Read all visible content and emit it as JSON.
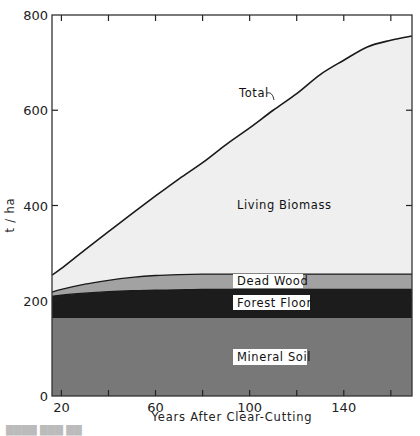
{
  "chart_data": {
    "type": "area",
    "stacked": true,
    "title": "",
    "xlabel": "Years After Clear-Cutting",
    "ylabel": "t/ha",
    "xlim": [
      16,
      169
    ],
    "ylim": [
      0,
      800
    ],
    "x_ticks": [
      20,
      40,
      60,
      80,
      100,
      120,
      140,
      160
    ],
    "x_tick_labels": [
      "20",
      "60",
      "100",
      "140"
    ],
    "x_tick_label_values": [
      20,
      60,
      100,
      140
    ],
    "y_ticks": [
      0,
      200,
      400,
      600,
      800
    ],
    "y_tick_labels": [
      "0",
      "200",
      "400",
      "600",
      "800"
    ],
    "grid": false,
    "legend": "inline labels",
    "x": [
      16,
      20,
      30,
      40,
      50,
      60,
      70,
      80,
      90,
      100,
      110,
      120,
      130,
      140,
      150,
      160,
      169
    ],
    "boundaries": [
      {
        "name": "Mineral Soil",
        "color": "#787878",
        "values": [
          164,
          164,
          164,
          164,
          164,
          164,
          164,
          164,
          164,
          164,
          164,
          164,
          164,
          164,
          164,
          164,
          164
        ]
      },
      {
        "name": "Forest Floor",
        "color": "#1c1c1c",
        "values": [
          209,
          212,
          216,
          219,
          221,
          222,
          223,
          224,
          224,
          224,
          224,
          224,
          224,
          224,
          224,
          224,
          224
        ]
      },
      {
        "name": "Dead Wood",
        "color": "#a2a2a2",
        "values": [
          218,
          224,
          235,
          243,
          249,
          253,
          255,
          256,
          256,
          256,
          256,
          256,
          256,
          256,
          256,
          256,
          256
        ]
      },
      {
        "name": "Living Biomass",
        "color": "#efefef",
        "values": [
          254,
          268,
          307,
          345,
          383,
          420,
          456,
          490,
          528,
          563,
          600,
          635,
          675,
          705,
          733,
          747,
          756
        ]
      }
    ],
    "series": [
      {
        "name": "Mineral Soil",
        "values": [
          164,
          164,
          164,
          164,
          164,
          164,
          164,
          164,
          164,
          164,
          164,
          164,
          164,
          164,
          164,
          164,
          164
        ]
      },
      {
        "name": "Forest Floor",
        "values": [
          45,
          48,
          52,
          55,
          57,
          58,
          59,
          60,
          60,
          60,
          60,
          60,
          60,
          60,
          60,
          60,
          60
        ]
      },
      {
        "name": "Dead Wood",
        "values": [
          9,
          12,
          19,
          24,
          28,
          31,
          32,
          32,
          32,
          32,
          32,
          32,
          32,
          32,
          32,
          32,
          32
        ]
      },
      {
        "name": "Living Biomass",
        "values": [
          36,
          44,
          72,
          102,
          134,
          167,
          201,
          234,
          272,
          307,
          344,
          379,
          419,
          449,
          477,
          491,
          500
        ]
      }
    ],
    "total": [
      254,
      268,
      307,
      345,
      383,
      420,
      456,
      490,
      528,
      563,
      600,
      635,
      675,
      705,
      733,
      747,
      756
    ],
    "annotations": [
      {
        "text": "Total",
        "x": 88,
        "y": 640,
        "points_to": "total curve"
      },
      {
        "text": "Living Biomass",
        "x": 112,
        "y": 405
      },
      {
        "text": "Dead Wood",
        "x": 112,
        "y": 240
      },
      {
        "text": "Forest Floor",
        "x": 112,
        "y": 196
      },
      {
        "text": "Mineral Soil",
        "x": 112,
        "y": 82
      }
    ]
  },
  "labels": {
    "total": "Total",
    "living_biomass": "Living Biomass",
    "dead_wood": "Dead Wood",
    "forest_floor": "Forest Floor",
    "mineral_soil": "Mineral Soil",
    "xlabel": "Years After Clear-Cutting",
    "ylabel": "t / ha"
  }
}
